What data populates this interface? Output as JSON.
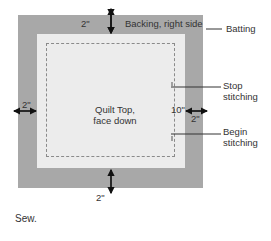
{
  "diagram": {
    "labels": {
      "backing": "Backing, right side",
      "batting": "Batting",
      "stop_stitching_line1": "Stop",
      "stop_stitching_line2": "stitching",
      "begin_stitching_line1": "Begin",
      "begin_stitching_line2": "stitching",
      "quilt_top_line1": "Quilt Top,",
      "quilt_top_line2": "face down",
      "opening": "10\"",
      "margin_top": "2\"",
      "margin_bottom": "2\"",
      "margin_left": "2\"",
      "margin_right": "2\""
    },
    "caption": "Sew.",
    "colors": {
      "backing": "#a8a8a8",
      "quilt_top": "#ececec",
      "stitch_line": "#8a8a8a",
      "arrow": "#111111"
    }
  }
}
